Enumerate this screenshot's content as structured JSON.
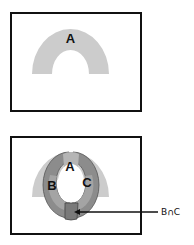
{
  "figure": {
    "panels": [
      {
        "id": "panel-top",
        "description": "Region A shown as a gray arch inside a rectangle",
        "regions": [
          {
            "label": "A",
            "color": "#cccccc"
          }
        ]
      },
      {
        "id": "panel-bottom",
        "description": "Regions B and C overlapping region A, forming a ring; their intersection is highlighted",
        "regions": [
          {
            "label": "A",
            "color": "#cccccc"
          },
          {
            "label": "B",
            "color": "#8a8a8a"
          },
          {
            "label": "C",
            "color": "#8a8a8a"
          }
        ],
        "callout": {
          "label": "B∩C",
          "target": "intersection of B and C"
        }
      }
    ],
    "colors": {
      "border": "#111111",
      "region_light": "#cccccc",
      "region_dark": "#8c8c8c",
      "region_mid": "#a8a8a8",
      "background": "#ffffff"
    }
  }
}
